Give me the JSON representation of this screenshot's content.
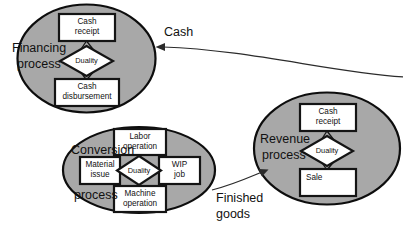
{
  "diagram": {
    "background_color": "#ffffff",
    "process_fill_color": "#a8a8a8",
    "entity_fill_color": "#ffffff",
    "outline_color": "#141414"
  },
  "processes": [
    {
      "id": "financing",
      "name_line1": "Financing",
      "name_line2": "process",
      "duality_label": "Duality",
      "entities": [
        {
          "id": "cash-receipt",
          "line1": "Cash",
          "line2": "receipt"
        },
        {
          "id": "cash-disbursement",
          "line1": "Cash",
          "line2": "disbursement"
        }
      ]
    },
    {
      "id": "conversion",
      "name_line1": "Conversion",
      "name_line2": "process",
      "duality_label": "Duality",
      "entities": [
        {
          "id": "labor-operation",
          "line1": "Labor",
          "line2": "operation"
        },
        {
          "id": "material-issue",
          "line1": "Material",
          "line2": "issue"
        },
        {
          "id": "wip-job",
          "line1": "WIP",
          "line2": "job"
        },
        {
          "id": "machine-operation",
          "line1": "Machine",
          "line2": "operation"
        }
      ]
    },
    {
      "id": "revenue",
      "name_line1": "Revenue",
      "name_line2": "process",
      "duality_label": "Duality",
      "entities": [
        {
          "id": "cash-receipt",
          "line1": "Cash",
          "line2": "receipt"
        },
        {
          "id": "sale",
          "line1": "Sale",
          "line2": ""
        }
      ]
    }
  ],
  "flows": [
    {
      "id": "cash-flow",
      "label": "Cash",
      "from": "revenue",
      "to": "financing"
    },
    {
      "id": "finished-goods-flow",
      "label_line1": "Finished",
      "label_line2": "goods",
      "from": "conversion",
      "to": "revenue"
    }
  ]
}
